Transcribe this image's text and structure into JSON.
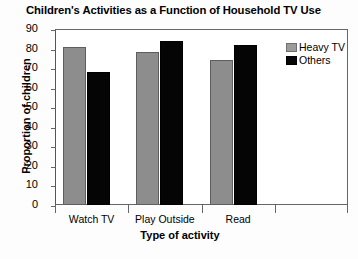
{
  "chart_data": {
    "type": "bar",
    "title": "Children's Activities as a Function of Household TV Use",
    "xlabel": "Type of activity",
    "ylabel": "Proportion of children",
    "categories": [
      "Watch TV",
      "Play Outside",
      "Read"
    ],
    "series": [
      {
        "name": "Heavy TV",
        "color": "#8d8d8d",
        "values": [
          81,
          78,
          74
        ]
      },
      {
        "name": "Others",
        "color": "#050505",
        "values": [
          68,
          84,
          82
        ]
      }
    ],
    "ylim": [
      0,
      90
    ],
    "yticks": [
      0,
      10,
      20,
      30,
      40,
      50,
      60,
      70,
      80,
      90
    ],
    "ytick_labels": [
      "0",
      "10",
      "20",
      "30",
      "40",
      "50",
      "60",
      "70",
      "80",
      "90"
    ],
    "grid": false,
    "legend_position": "top-right"
  }
}
